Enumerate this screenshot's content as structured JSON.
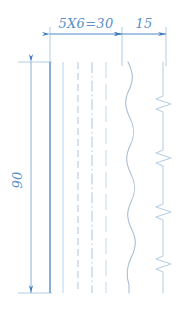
{
  "drawing": {
    "title": "Line types specimen drawing",
    "background_color": "#ffffff",
    "accent_color": "#5b8fc9",
    "line_color": "#a8c4e0",
    "dim_color": "#5b8fc9",
    "dimensions": {
      "top_left_label": "5X6=30",
      "top_right_label": "15",
      "vertical_label": "90"
    },
    "line_samples": [
      {
        "name": "continuous-thick-line",
        "style": "solid",
        "x": 50,
        "width": 1.8,
        "color": "#7aa8d4"
      },
      {
        "name": "continuous-thin-line",
        "style": "solid",
        "x": 63,
        "width": 1.0,
        "color": "#b9d0e6"
      },
      {
        "name": "dashed-line",
        "style": "dashed",
        "x": 78,
        "width": 1.0,
        "color": "#b9d0e6"
      },
      {
        "name": "dash-dot-line",
        "style": "dashdot",
        "x": 92,
        "width": 1.0,
        "color": "#b9d0e6"
      },
      {
        "name": "long-dash-line",
        "style": "longdash",
        "x": 106,
        "width": 1.0,
        "color": "#c6d9ec"
      },
      {
        "name": "wavy-break-line",
        "style": "wavy",
        "x": 128,
        "width": 1.0,
        "color": "#a9bed4"
      },
      {
        "name": "zigzag-break-line",
        "style": "zigzag",
        "x": 163,
        "width": 1.0,
        "color": "#b9cfe4"
      }
    ],
    "geometry": {
      "top_y": 62,
      "bottom_y": 293,
      "dim_line_y": 34,
      "ext_top_y": 27,
      "vertical_dim_x": 31
    }
  }
}
